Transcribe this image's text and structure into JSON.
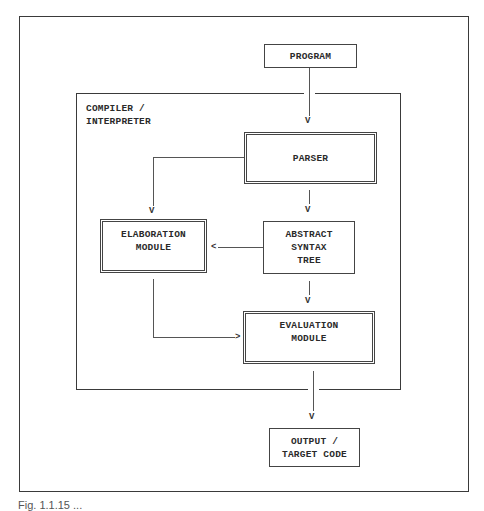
{
  "diagram": {
    "type": "flowchart",
    "container": {
      "label": "COMPILER /\nINTERPRETER"
    },
    "nodes": {
      "program": {
        "label": "PROGRAM",
        "style": "single"
      },
      "parser": {
        "label": "PARSER",
        "style": "double"
      },
      "ast": {
        "label": "ABSTRACT\nSYNTAX\nTREE",
        "style": "single"
      },
      "elaboration": {
        "label": "ELABORATION\nMODULE",
        "style": "double"
      },
      "evaluation": {
        "label": "EVALUATION\nMODULE",
        "style": "double"
      },
      "output": {
        "label": "OUTPUT /\nTARGET CODE",
        "style": "single"
      }
    },
    "edges": [
      {
        "from": "program",
        "to": "parser"
      },
      {
        "from": "parser",
        "to": "elaboration"
      },
      {
        "from": "parser",
        "to": "ast"
      },
      {
        "from": "ast",
        "to": "elaboration"
      },
      {
        "from": "ast",
        "to": "evaluation"
      },
      {
        "from": "elaboration",
        "to": "evaluation"
      },
      {
        "from": "evaluation",
        "to": "output"
      }
    ],
    "arrow_glyphs": {
      "down": "V",
      "left": "<",
      "right": ">"
    },
    "caption": "Fig. 1.1.15  ..."
  }
}
